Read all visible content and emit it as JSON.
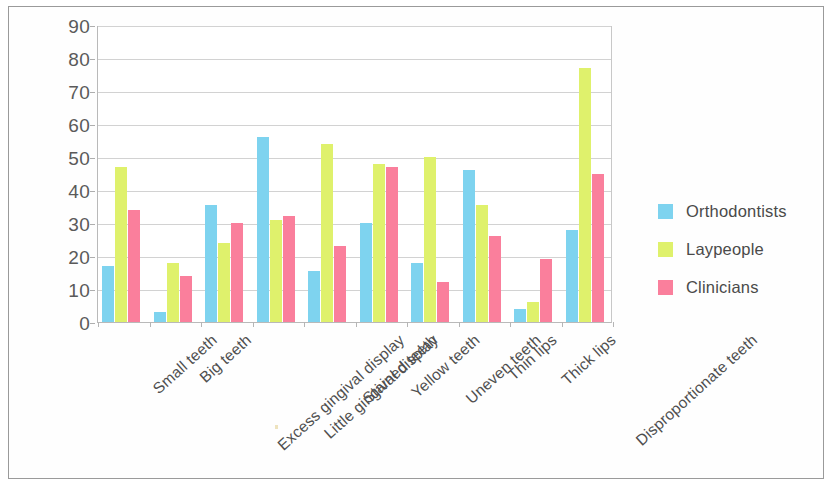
{
  "chart_data": {
    "type": "bar",
    "title": "",
    "subtitle": "",
    "xlabel": "",
    "ylabel": "",
    "ylim": [
      0,
      90
    ],
    "ytick_step": 10,
    "yticks": [
      90,
      80,
      70,
      60,
      50,
      40,
      30,
      20,
      10,
      0
    ],
    "grid": true,
    "legend_position": "right",
    "categories": [
      "Small teeth",
      "Big teeth",
      "Excess gingival display",
      "Little gingival display",
      "Stained teeth",
      "Yellow teeth",
      "Uneven teeth",
      "Thin lips",
      "Thick lips",
      "Disproportionate teeth"
    ],
    "series": [
      {
        "name": "Orthodontists",
        "color": "#7ed3ef",
        "values": [
          17,
          3,
          35.5,
          56,
          15.5,
          30,
          18,
          46,
          4,
          28
        ]
      },
      {
        "name": "Laypeople",
        "color": "#dff16c",
        "values": [
          47,
          18,
          24,
          31,
          54,
          48,
          50,
          35.5,
          6,
          77
        ]
      },
      {
        "name": "Clinicians",
        "color": "#fa7f9c",
        "values": [
          34,
          14,
          30,
          32,
          23,
          47,
          12,
          26,
          19,
          45
        ]
      }
    ]
  },
  "legend": {
    "items": [
      {
        "label": "Orthodontists",
        "color": "#7ed3ef"
      },
      {
        "label": "Laypeople",
        "color": "#dff16c"
      },
      {
        "label": "Clinicians",
        "color": "#fa7f9c"
      }
    ]
  }
}
